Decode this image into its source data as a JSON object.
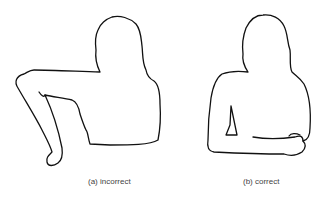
{
  "figures": [
    {
      "id": "a",
      "caption": "(a) incorrect",
      "description": "seated figure with arm reaching out and hanging"
    },
    {
      "id": "b",
      "caption": "(b) correct",
      "description": "seated figure with forearm resting horizontally on support"
    }
  ]
}
